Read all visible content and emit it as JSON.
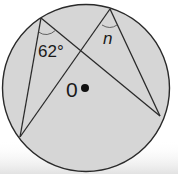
{
  "diagram": {
    "type": "circle-geometry",
    "circle": {
      "fill": "#d6d6d6",
      "stroke": "#2a2a2a"
    },
    "labels": {
      "angle_known": "62°",
      "angle_unknown": "n",
      "center": "0"
    },
    "points": {
      "A_top_left": [
        41,
        18
      ],
      "B_top_right": [
        110,
        9
      ],
      "C_bottom_left": [
        20,
        137
      ],
      "D_right": [
        160,
        116
      ],
      "O_center": [
        85,
        88
      ]
    },
    "chords": [
      [
        "A_top_left",
        "C_bottom_left"
      ],
      [
        "A_top_left",
        "D_right"
      ],
      [
        "B_top_right",
        "C_bottom_left"
      ],
      [
        "B_top_right",
        "D_right"
      ]
    ]
  }
}
